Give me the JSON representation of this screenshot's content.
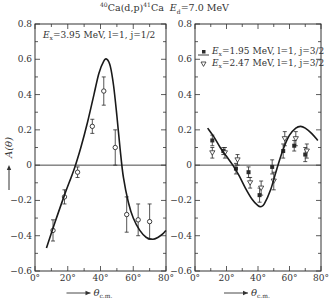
{
  "title": {
    "reaction": "40Ca(d,p)41Ca",
    "target_mass": "40",
    "target": "Ca",
    "channel": "(d,p)",
    "product_mass": "41",
    "product": "Ca",
    "energy_label": "E",
    "energy_sub": "d",
    "energy_value": "=7.0 MeV"
  },
  "colors": {
    "axis": "#333333",
    "curve": "#1a1a1a",
    "points": "#2a2a2a",
    "background": "#ffffff"
  },
  "chart_data": [
    {
      "type": "scatter",
      "panel": "left",
      "title": "40Ca(d,p)41Ca  Ed=7.0 MeV",
      "xlabel": "θ c.m.",
      "ylabel": "A(θ)",
      "xlim": [
        0,
        80
      ],
      "ylim": [
        -0.6,
        0.8
      ],
      "x_ticks": [
        "0°",
        "20°",
        "40°",
        "60°",
        "80°"
      ],
      "y_ticks": [
        "-0.6",
        "-0.4",
        "-0.2",
        "0",
        "0.2",
        "0.4",
        "0.6",
        "0.8"
      ],
      "grid": false,
      "zero_line": true,
      "annotation": "Ex=3.95 MeV, l=1, j=1/2",
      "series": [
        {
          "name": "Ex=3.95 MeV, l=1, j=1/2",
          "marker": "open-circle",
          "x": [
            11,
            18,
            26,
            35,
            42,
            49,
            56,
            63,
            70
          ],
          "y": [
            -0.37,
            -0.18,
            -0.04,
            0.22,
            0.42,
            0.1,
            -0.28,
            -0.31,
            -0.32
          ],
          "err": [
            0.06,
            0.04,
            0.03,
            0.04,
            0.08,
            0.1,
            0.1,
            0.09,
            0.1
          ]
        },
        {
          "name": "theory curve",
          "marker": "line",
          "x": [
            7,
            12,
            18,
            24,
            28,
            32,
            36,
            39,
            42,
            44,
            46,
            48,
            50,
            52,
            54,
            57,
            60,
            64,
            68,
            72,
            75,
            78,
            80
          ],
          "y": [
            -0.47,
            -0.33,
            -0.17,
            -0.02,
            0.1,
            0.24,
            0.4,
            0.52,
            0.59,
            0.6,
            0.56,
            0.45,
            0.28,
            0.09,
            -0.07,
            -0.21,
            -0.3,
            -0.37,
            -0.41,
            -0.42,
            -0.41,
            -0.39,
            -0.37
          ]
        }
      ]
    },
    {
      "type": "scatter",
      "panel": "right",
      "xlabel": "θ c.m.",
      "ylabel": "A(θ)",
      "xlim": [
        0,
        80
      ],
      "ylim": [
        -0.6,
        0.8
      ],
      "x_ticks": [
        "0°",
        "20°",
        "40°",
        "60°",
        "80°"
      ],
      "y_ticks": [
        "-0.6",
        "-0.4",
        "-0.2",
        "0",
        "0.2",
        "0.4",
        "0.6",
        "0.8"
      ],
      "grid": false,
      "zero_line": true,
      "legend": [
        {
          "marker": "filled-circle",
          "label": "Ex=1.95 MeV, l=1, j=3/2"
        },
        {
          "marker": "open-triangle",
          "label": "Ex=2.47 MeV, l=1, j=3/2"
        }
      ],
      "legend_position": "upper",
      "series": [
        {
          "name": "Ex=1.95 MeV, l=1, j=3/2",
          "marker": "filled-circle",
          "x": [
            11,
            18,
            26,
            34,
            41,
            49,
            56,
            63,
            70
          ],
          "y": [
            0.14,
            0.08,
            -0.02,
            -0.04,
            -0.17,
            -0.01,
            0.08,
            0.11,
            0.06
          ],
          "err": [
            0.03,
            0.02,
            0.03,
            0.03,
            0.04,
            0.04,
            0.04,
            0.03,
            0.04
          ]
        },
        {
          "name": "Ex=2.47 MeV, l=1, j=3/2",
          "marker": "open-triangle",
          "x": [
            11,
            19,
            27,
            35,
            42,
            50,
            57,
            64,
            71
          ],
          "y": [
            0.07,
            0.07,
            0.03,
            -0.1,
            -0.13,
            -0.09,
            0.15,
            0.15,
            0.08
          ],
          "err": [
            0.03,
            0.03,
            0.03,
            0.03,
            0.04,
            0.05,
            0.04,
            0.04,
            0.04
          ]
        },
        {
          "name": "theory curve",
          "marker": "line",
          "x": [
            8,
            12,
            16,
            20,
            24,
            28,
            32,
            36,
            40,
            42,
            44,
            48,
            52,
            56,
            60,
            64,
            67,
            70,
            74,
            78
          ],
          "y": [
            0.21,
            0.16,
            0.1,
            0.05,
            0.0,
            -0.06,
            -0.13,
            -0.19,
            -0.23,
            -0.235,
            -0.22,
            -0.14,
            -0.02,
            0.09,
            0.17,
            0.21,
            0.22,
            0.21,
            0.18,
            0.14
          ]
        }
      ]
    }
  ],
  "panels": {
    "left": {
      "annotation": {
        "E": "E",
        "sub": "x",
        "rest": "=3.95 MeV,  l=1,  j=1/2"
      }
    },
    "right": {
      "legend": [
        {
          "E": "E",
          "sub": "x",
          "rest": "=1.95 MeV,  l=1,  j=3/2"
        },
        {
          "E": "E",
          "sub": "x",
          "rest": "=2.47 MeV,  l=1,  j=3/2"
        }
      ]
    }
  },
  "axes": {
    "ylabel": "A(θ)",
    "xlabel": "θ",
    "xlabel_sub": "c.m.",
    "x_tick_labels": [
      "0°",
      "20°",
      "40°",
      "60°",
      "80°"
    ],
    "y_tick_labels": [
      "0.8",
      "0.6",
      "0.4",
      "0.2",
      "0",
      "−0.2",
      "−0.4",
      "−0.6"
    ]
  }
}
